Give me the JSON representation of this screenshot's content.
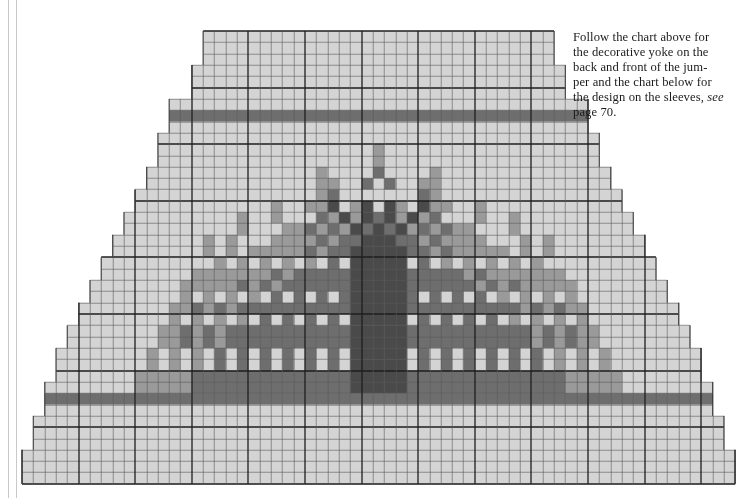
{
  "page": {
    "background_color": "#ffffff",
    "width": 737,
    "height": 498
  },
  "rules": {
    "color": "#c9c9c9",
    "count": 2
  },
  "caption": {
    "line1": "Follow the chart above for",
    "line2": "the decorative yoke on the",
    "line3": "back and front of the jum-",
    "line4": "per and the chart below for",
    "line5": "the design on the sleeves,",
    "line6_italic": "see",
    "line6_rest": " page 70.",
    "full_text": "Follow the chart above for the decorative yoke on the back and front of the jumper and the chart below for the design on the sleeves, see page 70.",
    "text_color": "#1b1b1b"
  },
  "chart_data": {
    "type": "heatmap",
    "title": "",
    "xlabel": "",
    "ylabel": "",
    "grid": {
      "cols": 63,
      "rows": 40,
      "cell_w": 11.32,
      "cell_h": 11.32,
      "origin_x": 22,
      "origin_y": 31,
      "minor_line_color": "#5a5a5a",
      "minor_line_width": 0.6,
      "major_line_color": "#1e1e1e",
      "major_line_width": 1.3,
      "major_every": 5,
      "grid_on": true
    },
    "palette": {
      "0": "#ffffff",
      "1": "#d4d4d4",
      "2": "#9a9a9a",
      "3": "#6e6e6e",
      "4": "#4a4a4a"
    },
    "legend": {
      "position": "none",
      "entries": [
        {
          "key": "0",
          "label": "background / main colour",
          "color": "#ffffff"
        },
        {
          "key": "1",
          "label": "light shade",
          "color": "#d4d4d4"
        },
        {
          "key": "2",
          "label": "mid shade",
          "color": "#9a9a9a"
        },
        {
          "key": "3",
          "label": "dark shade",
          "color": "#6e6e6e"
        },
        {
          "key": "4",
          "label": "darkest shade",
          "color": "#4a4a4a"
        }
      ]
    },
    "row_extents": [
      [
        16,
        46
      ],
      [
        16,
        46
      ],
      [
        16,
        46
      ],
      [
        15,
        47
      ],
      [
        15,
        47
      ],
      [
        15,
        47
      ],
      [
        13,
        49
      ],
      [
        13,
        49
      ],
      [
        13,
        49
      ],
      [
        12,
        50
      ],
      [
        12,
        50
      ],
      [
        12,
        50
      ],
      [
        11,
        51
      ],
      [
        11,
        51
      ],
      [
        10,
        52
      ],
      [
        10,
        52
      ],
      [
        9,
        53
      ],
      [
        9,
        53
      ],
      [
        8,
        54
      ],
      [
        8,
        54
      ],
      [
        7,
        55
      ],
      [
        7,
        55
      ],
      [
        6,
        56
      ],
      [
        6,
        56
      ],
      [
        5,
        57
      ],
      [
        5,
        57
      ],
      [
        4,
        58
      ],
      [
        4,
        58
      ],
      [
        3,
        59
      ],
      [
        3,
        59
      ],
      [
        3,
        59
      ],
      [
        2,
        60
      ],
      [
        2,
        60
      ],
      [
        2,
        60
      ],
      [
        1,
        61
      ],
      [
        1,
        61
      ],
      [
        1,
        61
      ],
      [
        0,
        62
      ],
      [
        0,
        62
      ],
      [
        0,
        62
      ]
    ],
    "band_rows": [
      7,
      32
    ],
    "band_color_key": "3",
    "motif_rows": {
      "10": [
        [
          31,
          2
        ]
      ],
      "11": [
        [
          31,
          2
        ],
        [
          36,
          1
        ]
      ],
      "12": [
        [
          27,
          1
        ],
        [
          31,
          3
        ],
        [
          36,
          2
        ],
        [
          41,
          1
        ]
      ],
      "13": [
        [
          24,
          1
        ],
        [
          27,
          2
        ],
        [
          30,
          3
        ],
        [
          36,
          2
        ],
        [
          41,
          1
        ]
      ],
      "14": [
        [
          22,
          1
        ],
        [
          24,
          1
        ],
        [
          27,
          3
        ],
        [
          29,
          4
        ],
        [
          33,
          1
        ],
        [
          36,
          2
        ],
        [
          40,
          1
        ],
        [
          43,
          1
        ]
      ],
      "15": [
        [
          22,
          1
        ],
        [
          25,
          2
        ],
        [
          27,
          4
        ],
        [
          29,
          4
        ],
        [
          30,
          4
        ],
        [
          33,
          2
        ],
        [
          36,
          2
        ],
        [
          40,
          2
        ],
        [
          43,
          1
        ],
        [
          45,
          1
        ]
      ],
      "16": [
        [
          21,
          1
        ],
        [
          24,
          2
        ],
        [
          26,
          3
        ],
        [
          28,
          4
        ],
        [
          29,
          4
        ],
        [
          30,
          4
        ],
        [
          31,
          3
        ],
        [
          33,
          2
        ],
        [
          35,
          2
        ],
        [
          38,
          1
        ],
        [
          40,
          2
        ],
        [
          43,
          2
        ],
        [
          46,
          1
        ]
      ],
      "17": [
        [
          20,
          1
        ],
        [
          23,
          2
        ],
        [
          25,
          3
        ],
        [
          27,
          3
        ],
        [
          29,
          4
        ],
        [
          30,
          4
        ],
        [
          31,
          4
        ],
        [
          32,
          3
        ],
        [
          34,
          2
        ],
        [
          36,
          2
        ],
        [
          38,
          2
        ],
        [
          41,
          1
        ],
        [
          43,
          2
        ],
        [
          46,
          1
        ]
      ],
      "18": [
        [
          19,
          1
        ],
        [
          22,
          2
        ],
        [
          24,
          2
        ],
        [
          26,
          3
        ],
        [
          28,
          3
        ],
        [
          30,
          4
        ],
        [
          31,
          4
        ],
        [
          32,
          4
        ],
        [
          33,
          3
        ],
        [
          35,
          2
        ],
        [
          37,
          2
        ],
        [
          39,
          2
        ],
        [
          42,
          1
        ],
        [
          44,
          2
        ],
        [
          46,
          2
        ]
      ],
      "19": [
        [
          18,
          1
        ],
        [
          21,
          2
        ],
        [
          23,
          2
        ],
        [
          25,
          3
        ],
        [
          27,
          3
        ],
        [
          29,
          3
        ],
        [
          31,
          4
        ],
        [
          32,
          4
        ],
        [
          33,
          4
        ],
        [
          34,
          3
        ],
        [
          36,
          2
        ],
        [
          38,
          2
        ],
        [
          40,
          2
        ],
        [
          42,
          2
        ],
        [
          44,
          2
        ],
        [
          46,
          2
        ]
      ],
      "20": [
        [
          17,
          2
        ],
        [
          19,
          1
        ],
        [
          21,
          2
        ],
        [
          23,
          3
        ],
        [
          25,
          3
        ],
        [
          27,
          3
        ],
        [
          29,
          3
        ],
        [
          31,
          4
        ],
        [
          32,
          4
        ],
        [
          33,
          4
        ],
        [
          35,
          3
        ],
        [
          37,
          2
        ],
        [
          39,
          2
        ],
        [
          41,
          2
        ],
        [
          43,
          2
        ],
        [
          45,
          2
        ],
        [
          47,
          1
        ]
      ],
      "21": [
        [
          16,
          2
        ],
        [
          18,
          2
        ],
        [
          20,
          2
        ],
        [
          22,
          3
        ],
        [
          24,
          3
        ],
        [
          26,
          3
        ],
        [
          28,
          3
        ],
        [
          30,
          3
        ],
        [
          31,
          4
        ],
        [
          32,
          4
        ],
        [
          33,
          4
        ],
        [
          35,
          3
        ],
        [
          37,
          3
        ],
        [
          39,
          2
        ],
        [
          41,
          2
        ],
        [
          43,
          2
        ],
        [
          45,
          2
        ],
        [
          47,
          2
        ]
      ],
      "22": [
        [
          15,
          2
        ],
        [
          17,
          2
        ],
        [
          19,
          3
        ],
        [
          21,
          3
        ],
        [
          23,
          3
        ],
        [
          25,
          3
        ],
        [
          27,
          3
        ],
        [
          29,
          3
        ],
        [
          31,
          4
        ],
        [
          32,
          4
        ],
        [
          33,
          4
        ],
        [
          34,
          3
        ],
        [
          36,
          3
        ],
        [
          38,
          3
        ],
        [
          40,
          2
        ],
        [
          42,
          2
        ],
        [
          44,
          2
        ],
        [
          46,
          2
        ],
        [
          48,
          2
        ]
      ],
      "23": [
        [
          14,
          2
        ],
        [
          16,
          2
        ],
        [
          18,
          3
        ],
        [
          20,
          3
        ],
        [
          22,
          3
        ],
        [
          24,
          3
        ],
        [
          26,
          3
        ],
        [
          28,
          3
        ],
        [
          30,
          3
        ],
        [
          31,
          4
        ],
        [
          32,
          4
        ],
        [
          33,
          4
        ],
        [
          34,
          3
        ],
        [
          36,
          3
        ],
        [
          38,
          3
        ],
        [
          40,
          3
        ],
        [
          42,
          2
        ],
        [
          44,
          2
        ],
        [
          46,
          2
        ],
        [
          48,
          2
        ]
      ],
      "24": [
        [
          13,
          2
        ],
        [
          15,
          3
        ],
        [
          17,
          3
        ],
        [
          19,
          3
        ],
        [
          21,
          3
        ],
        [
          23,
          3
        ],
        [
          25,
          3
        ],
        [
          27,
          3
        ],
        [
          29,
          3
        ],
        [
          31,
          4
        ],
        [
          32,
          4
        ],
        [
          33,
          4
        ],
        [
          34,
          3
        ],
        [
          36,
          3
        ],
        [
          38,
          3
        ],
        [
          40,
          3
        ],
        [
          42,
          3
        ],
        [
          44,
          2
        ],
        [
          46,
          2
        ],
        [
          48,
          2
        ],
        [
          50,
          1
        ]
      ],
      "25": [
        [
          13,
          2
        ],
        [
          15,
          3
        ],
        [
          17,
          3
        ],
        [
          19,
          3
        ],
        [
          21,
          3
        ],
        [
          23,
          3
        ],
        [
          25,
          3
        ],
        [
          27,
          3
        ],
        [
          29,
          3
        ],
        [
          31,
          4
        ],
        [
          32,
          4
        ],
        [
          33,
          4
        ],
        [
          35,
          3
        ],
        [
          37,
          3
        ],
        [
          39,
          3
        ],
        [
          41,
          3
        ],
        [
          43,
          2
        ],
        [
          45,
          2
        ],
        [
          47,
          2
        ],
        [
          49,
          2
        ]
      ],
      "26": [
        [
          12,
          2
        ],
        [
          14,
          3
        ],
        [
          16,
          3
        ],
        [
          18,
          3
        ],
        [
          20,
          3
        ],
        [
          22,
          3
        ],
        [
          24,
          3
        ],
        [
          26,
          3
        ],
        [
          28,
          3
        ],
        [
          30,
          3
        ],
        [
          31,
          4
        ],
        [
          32,
          4
        ],
        [
          33,
          4
        ],
        [
          35,
          3
        ],
        [
          37,
          3
        ],
        [
          39,
          3
        ],
        [
          41,
          3
        ],
        [
          43,
          3
        ],
        [
          45,
          2
        ],
        [
          47,
          2
        ],
        [
          49,
          2
        ]
      ],
      "27": [
        [
          12,
          2
        ],
        [
          14,
          3
        ],
        [
          16,
          3
        ],
        [
          18,
          3
        ],
        [
          20,
          3
        ],
        [
          22,
          3
        ],
        [
          24,
          3
        ],
        [
          26,
          3
        ],
        [
          28,
          3
        ],
        [
          30,
          3
        ],
        [
          31,
          4
        ],
        [
          32,
          4
        ],
        [
          33,
          4
        ],
        [
          35,
          3
        ],
        [
          37,
          3
        ],
        [
          39,
          3
        ],
        [
          41,
          3
        ],
        [
          43,
          3
        ],
        [
          45,
          2
        ],
        [
          47,
          2
        ],
        [
          49,
          2
        ]
      ],
      "28": [
        [
          11,
          2
        ],
        [
          13,
          2
        ],
        [
          15,
          3
        ],
        [
          17,
          3
        ],
        [
          19,
          3
        ],
        [
          21,
          3
        ],
        [
          23,
          3
        ],
        [
          25,
          3
        ],
        [
          27,
          3
        ],
        [
          29,
          3
        ],
        [
          31,
          4
        ],
        [
          32,
          4
        ],
        [
          33,
          4
        ],
        [
          35,
          3
        ],
        [
          37,
          3
        ],
        [
          39,
          3
        ],
        [
          41,
          3
        ],
        [
          43,
          3
        ],
        [
          45,
          3
        ],
        [
          47,
          2
        ],
        [
          49,
          2
        ]
      ],
      "29": [
        [
          11,
          2
        ],
        [
          13,
          2
        ],
        [
          15,
          3
        ],
        [
          17,
          3
        ],
        [
          19,
          3
        ],
        [
          21,
          3
        ],
        [
          23,
          3
        ],
        [
          25,
          3
        ],
        [
          27,
          3
        ],
        [
          29,
          3
        ],
        [
          31,
          4
        ],
        [
          32,
          4
        ],
        [
          33,
          4
        ],
        [
          35,
          3
        ],
        [
          37,
          3
        ],
        [
          39,
          3
        ],
        [
          41,
          3
        ],
        [
          43,
          3
        ],
        [
          45,
          3
        ],
        [
          47,
          2
        ],
        [
          49,
          2
        ]
      ],
      "30": [
        [
          10,
          2
        ],
        [
          12,
          2
        ],
        [
          14,
          2
        ],
        [
          16,
          3
        ],
        [
          18,
          3
        ],
        [
          20,
          3
        ],
        [
          22,
          3
        ],
        [
          24,
          3
        ],
        [
          26,
          3
        ],
        [
          28,
          3
        ],
        [
          30,
          3
        ],
        [
          31,
          4
        ],
        [
          32,
          4
        ],
        [
          33,
          4
        ],
        [
          35,
          3
        ],
        [
          37,
          3
        ],
        [
          39,
          3
        ],
        [
          41,
          3
        ],
        [
          43,
          3
        ],
        [
          45,
          3
        ],
        [
          47,
          3
        ],
        [
          49,
          2
        ],
        [
          51,
          2
        ]
      ],
      "31": [
        [
          10,
          2
        ],
        [
          12,
          2
        ],
        [
          14,
          2
        ],
        [
          16,
          3
        ],
        [
          18,
          3
        ],
        [
          20,
          3
        ],
        [
          22,
          3
        ],
        [
          24,
          3
        ],
        [
          26,
          3
        ],
        [
          28,
          3
        ],
        [
          30,
          3
        ],
        [
          31,
          4
        ],
        [
          32,
          4
        ],
        [
          33,
          4
        ],
        [
          35,
          3
        ],
        [
          37,
          3
        ],
        [
          39,
          3
        ],
        [
          41,
          3
        ],
        [
          43,
          3
        ],
        [
          45,
          3
        ],
        [
          47,
          3
        ],
        [
          49,
          2
        ],
        [
          51,
          2
        ]
      ]
    }
  }
}
